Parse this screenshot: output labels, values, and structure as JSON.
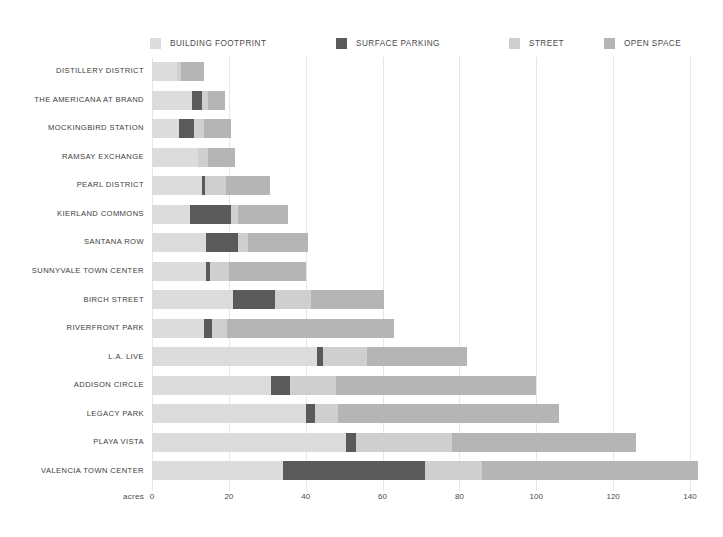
{
  "chart_data": {
    "type": "bar",
    "orientation": "horizontal",
    "stacked": true,
    "title": "",
    "subtitle": "",
    "xlabel": "acres",
    "ylabel": "",
    "xlim": [
      0,
      140
    ],
    "xticks": [
      0,
      20,
      40,
      60,
      80,
      100,
      120,
      140
    ],
    "xtick_labels": [
      "0",
      "20",
      "40",
      "60",
      "80",
      "100",
      "120",
      "140"
    ],
    "grid": true,
    "grid_axis": "x",
    "legend_position": "top",
    "categories": [
      "DISTILLERY DISTRICT",
      "THE AMERICANA AT BRAND",
      "MOCKINGBIRD STATION",
      "RAMSAY EXCHANGE",
      "PEARL DISTRICT",
      "KIERLAND COMMONS",
      "SANTANA ROW",
      "SUNNYVALE TOWN CENTER",
      "BIRCH STREET",
      "RIVERFRONT PARK",
      "L.A. LIVE",
      "ADDISON CIRCLE",
      "LEGACY PARK",
      "PLAYA VISTA",
      "VALENCIA TOWN CENTER"
    ],
    "series": [
      {
        "name": "BUILDING FOOTPRINT",
        "color": "#dcdcdc",
        "values": [
          6.5,
          10.5,
          7.0,
          12.0,
          13.0,
          10.0,
          14.0,
          14.0,
          21.0,
          13.5,
          43.0,
          31.0,
          40.0,
          50.5,
          34.0
        ]
      },
      {
        "name": "SURFACE PARKING",
        "color": "#5a5a5a",
        "values": [
          0.0,
          2.5,
          4.0,
          0.0,
          0.8,
          10.5,
          8.5,
          1.0,
          11.0,
          2.0,
          1.5,
          5.0,
          2.5,
          2.5,
          37.0
        ]
      },
      {
        "name": "STREET",
        "color": "#cfcfcf",
        "values": [
          1.0,
          1.5,
          2.5,
          2.5,
          5.5,
          2.0,
          2.5,
          5.0,
          9.5,
          4.0,
          11.5,
          12.0,
          6.0,
          25.0,
          15.0
        ]
      },
      {
        "name": "OPEN SPACE",
        "color": "#b5b5b5",
        "values": [
          6.0,
          4.5,
          7.0,
          7.0,
          11.5,
          13.0,
          15.5,
          20.0,
          19.0,
          43.5,
          26.0,
          52.0,
          57.5,
          48.0,
          56.0
        ]
      }
    ],
    "totals": [
      13.5,
      19.0,
      20.5,
      21.5,
      30.8,
      35.5,
      40.5,
      40.0,
      60.5,
      63.0,
      82.0,
      100.0,
      106.0,
      126.0,
      142.0
    ]
  },
  "legend": {
    "items": [
      {
        "label": "BUILDING FOOTPRINT",
        "color": "#dcdcdc",
        "left": 0
      },
      {
        "label": "SURFACE PARKING",
        "color": "#5a5a5a",
        "left": 186
      },
      {
        "label": "STREET",
        "color": "#cfcfcf",
        "left": 359
      },
      {
        "label": "OPEN SPACE",
        "color": "#b5b5b5",
        "left": 454
      }
    ]
  },
  "axis": {
    "x_title": "acres"
  }
}
